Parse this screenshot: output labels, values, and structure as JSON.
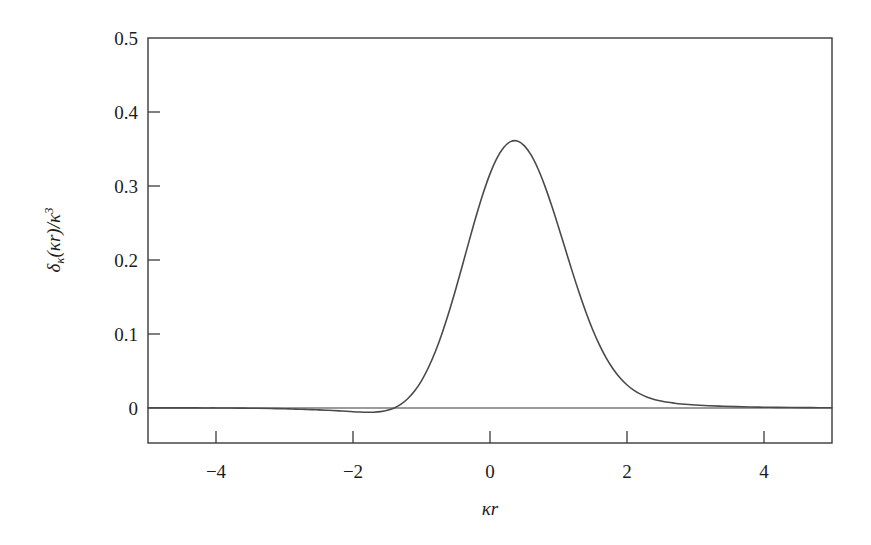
{
  "figure": {
    "background_color": "#ffffff",
    "width": 871,
    "height": 545
  },
  "chart_data": {
    "type": "line",
    "title": "",
    "subtitle": "",
    "xlabel": "κr",
    "ylabel": "δκ(κr)/κ³",
    "ylabel_parts": {
      "delta": "δ",
      "delta_sub": "κ",
      "open_paren": "(",
      "arg": "κr",
      "close_paren": ")",
      "slash": "/",
      "kappa": "κ",
      "exponent": "3"
    },
    "xlabel_parts": {
      "kappa": "κ",
      "r": "r"
    },
    "xlim": [
      -5,
      5
    ],
    "ylim": [
      -0.047,
      0.5
    ],
    "grid": false,
    "legend": null,
    "xticks": [
      -4,
      -2,
      0,
      2,
      4
    ],
    "xtick_labels": [
      "−4",
      "−2",
      "0",
      "2",
      "4"
    ],
    "yticks": [
      0,
      0.1,
      0.2,
      0.3,
      0.4,
      0.5
    ],
    "ytick_labels": [
      "0",
      "0.1",
      "0.2",
      "0.3",
      "0.4",
      "0.5"
    ],
    "peak_value": 0.447,
    "peak_x": 0,
    "sidelobe_min_value": -0.006,
    "sidelobe_min_x": [
      -1.9,
      1.9
    ],
    "line_color": "#4a4a4a",
    "axis_color": "#3a3a3a",
    "x": [
      -5.0,
      -4.8,
      -4.6,
      -4.4,
      -4.2,
      -4.0,
      -3.8,
      -3.6,
      -3.4,
      -3.2,
      -3.0,
      -2.9,
      -2.8,
      -2.7,
      -2.6,
      -2.5,
      -2.4,
      -2.3,
      -2.2,
      -2.1,
      -2.0,
      -1.9,
      -1.8,
      -1.7,
      -1.6,
      -1.5,
      -1.4,
      -1.3,
      -1.2,
      -1.1,
      -1.0,
      -0.9,
      -0.8,
      -0.7,
      -0.6,
      -0.5,
      -0.4,
      -0.3,
      -0.2,
      -0.1,
      0.0,
      0.1,
      0.2,
      0.3,
      0.4,
      0.5,
      0.6,
      0.7,
      0.8,
      0.9,
      1.0,
      1.1,
      1.2,
      1.3,
      1.4,
      1.5,
      1.6,
      1.7,
      1.8,
      1.9,
      2.0,
      2.1,
      2.2,
      2.3,
      2.4,
      2.5,
      2.6,
      2.7,
      2.8,
      2.9,
      3.0,
      3.2,
      3.4,
      3.6,
      3.8,
      4.0,
      4.2,
      4.4,
      4.6,
      4.8,
      5.0
    ],
    "y": [
      0.0002,
      0.0002,
      0.0002,
      0.0002,
      0.0001,
      0.0001,
      0.0,
      -0.0002,
      -0.0004,
      -0.0007,
      -0.0011,
      -0.0013,
      -0.0016,
      -0.0019,
      -0.0022,
      -0.0026,
      -0.003,
      -0.0034,
      -0.0039,
      -0.0044,
      -0.005,
      -0.0055,
      -0.0058,
      -0.0057,
      -0.0049,
      -0.0031,
      0.0001,
      0.0052,
      0.0128,
      0.0232,
      0.0371,
      0.0547,
      0.076,
      0.1011,
      0.1296,
      0.1608,
      0.1939,
      0.2275,
      0.2601,
      0.2902,
      0.3164,
      0.3374,
      0.3521,
      0.36,
      0.3608,
      0.3546,
      0.342,
      0.3236,
      0.3005,
      0.2739,
      0.245,
      0.2151,
      0.1853,
      0.1567,
      0.1301,
      0.1061,
      0.0852,
      0.0674,
      0.0527,
      0.0408,
      0.0314,
      0.0242,
      0.0187,
      0.0146,
      0.0116,
      0.0094,
      0.0077,
      0.0065,
      0.0055,
      0.0047,
      0.0041,
      0.0031,
      0.0024,
      0.0018,
      0.0014,
      0.0011,
      0.0008,
      0.0006,
      0.0005,
      0.0004,
      0.0003
    ]
  }
}
